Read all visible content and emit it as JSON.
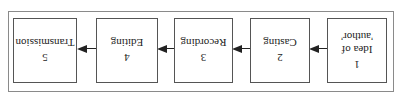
{
  "diagram": {
    "orientation": "rotated-180",
    "steps": [
      {
        "number": "1",
        "label": "Idea of 'author'"
      },
      {
        "number": "2",
        "label": "Casting"
      },
      {
        "number": "3",
        "label": "Recording"
      },
      {
        "number": "4",
        "label": "Editing"
      },
      {
        "number": "5",
        "label": "Transmission"
      }
    ],
    "step1_lines": [
      "Idea of",
      "'author'"
    ],
    "colors": {
      "stroke": "#222222",
      "frame": "#8a8a8a",
      "background": "#ffffff"
    }
  }
}
